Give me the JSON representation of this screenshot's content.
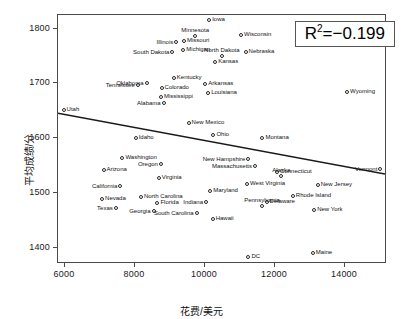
{
  "chart_data": {
    "type": "scatter",
    "title": "",
    "xlabel": "花费/美元",
    "ylabel": "平均成绩/分",
    "xlim": [
      5800,
      15200
    ],
    "ylim": [
      1370,
      1825
    ],
    "xticks": [
      "6000",
      "8000",
      "10000",
      "12000",
      "14000"
    ],
    "xtick_values": [
      6000,
      8000,
      10000,
      12000,
      14000
    ],
    "yticks": [
      "1400",
      "1500",
      "1600",
      "1700",
      "1800"
    ],
    "ytick_values": [
      1400,
      1500,
      1600,
      1700,
      1800
    ],
    "grid": false,
    "legend": null,
    "annotation": {
      "text": "R2=-0.199",
      "display": "R",
      "sup": "2",
      "rest": "=−0.199",
      "position": "top-right"
    },
    "trendline": {
      "type": "linear",
      "x_start": 5800,
      "y_start": 1644,
      "x_end": 15200,
      "y_end": 1532,
      "color": "#1a1a1a"
    },
    "point_color": "#2a2a2a",
    "points": [
      {
        "label": "Iowa",
        "x": 10120,
        "y": 1815,
        "lpos": "r"
      },
      {
        "label": "Wisconsin",
        "x": 11030,
        "y": 1788,
        "lpos": "r"
      },
      {
        "label": "Minnesota",
        "x": 9720,
        "y": 1786,
        "lpos": "t"
      },
      {
        "label": "Missouri",
        "x": 9400,
        "y": 1778,
        "lpos": "r"
      },
      {
        "label": "Illinois",
        "x": 9180,
        "y": 1776,
        "lpos": "l"
      },
      {
        "label": "Michigan",
        "x": 9380,
        "y": 1761,
        "lpos": "r"
      },
      {
        "label": "South Dakota",
        "x": 9070,
        "y": 1758,
        "lpos": "l"
      },
      {
        "label": "Nebraska",
        "x": 11160,
        "y": 1757,
        "lpos": "r"
      },
      {
        "label": "North Dakota",
        "x": 10480,
        "y": 1750,
        "lpos": "t"
      },
      {
        "label": "Kansas",
        "x": 10290,
        "y": 1739,
        "lpos": "r"
      },
      {
        "label": "Kentucky",
        "x": 9110,
        "y": 1709,
        "lpos": "r"
      },
      {
        "label": "Oklahoma",
        "x": 8330,
        "y": 1701,
        "lpos": "l"
      },
      {
        "label": "Tennessee",
        "x": 8080,
        "y": 1698,
        "lpos": "l"
      },
      {
        "label": "Arkansas",
        "x": 10010,
        "y": 1699,
        "lpos": "r"
      },
      {
        "label": "Colorado",
        "x": 8760,
        "y": 1691,
        "lpos": "r"
      },
      {
        "label": "Louisiana",
        "x": 10090,
        "y": 1683,
        "lpos": "r"
      },
      {
        "label": "Wyoming",
        "x": 14060,
        "y": 1684,
        "lpos": "r"
      },
      {
        "label": "Mississippi",
        "x": 8740,
        "y": 1676,
        "lpos": "r"
      },
      {
        "label": "Alabama",
        "x": 8820,
        "y": 1665,
        "lpos": "l"
      },
      {
        "label": "Utah",
        "x": 5960,
        "y": 1651,
        "lpos": "r"
      },
      {
        "label": "New Mexico",
        "x": 9530,
        "y": 1628,
        "lpos": "r"
      },
      {
        "label": "Ohio",
        "x": 10240,
        "y": 1605,
        "lpos": "r"
      },
      {
        "label": "Montana",
        "x": 11640,
        "y": 1601,
        "lpos": "r"
      },
      {
        "label": "Idaho",
        "x": 8020,
        "y": 1600,
        "lpos": "r"
      },
      {
        "label": "Washington",
        "x": 7640,
        "y": 1564,
        "lpos": "r"
      },
      {
        "label": "New Hampshire",
        "x": 11240,
        "y": 1561,
        "lpos": "l"
      },
      {
        "label": "Oregon",
        "x": 8740,
        "y": 1552,
        "lpos": "l"
      },
      {
        "label": "Massachusetts",
        "x": 11430,
        "y": 1549,
        "lpos": "l"
      },
      {
        "label": "Vermont",
        "x": 15010,
        "y": 1544,
        "lpos": "l"
      },
      {
        "label": "Arizona",
        "x": 7100,
        "y": 1542,
        "lpos": "r"
      },
      {
        "label": "Connecticut",
        "x": 12060,
        "y": 1538,
        "lpos": "r"
      },
      {
        "label": "Alaska",
        "x": 12180,
        "y": 1531,
        "lpos": "t"
      },
      {
        "label": "Virginia",
        "x": 8680,
        "y": 1527,
        "lpos": "r"
      },
      {
        "label": "California",
        "x": 7580,
        "y": 1512,
        "lpos": "l"
      },
      {
        "label": "West Virginia",
        "x": 11200,
        "y": 1516,
        "lpos": "r"
      },
      {
        "label": "New Jersey",
        "x": 13220,
        "y": 1514,
        "lpos": "r"
      },
      {
        "label": "Maryland",
        "x": 10150,
        "y": 1503,
        "lpos": "r"
      },
      {
        "label": "Rhode Island",
        "x": 12510,
        "y": 1494,
        "lpos": "r"
      },
      {
        "label": "North Carolina",
        "x": 8170,
        "y": 1492,
        "lpos": "r"
      },
      {
        "label": "Nevada",
        "x": 7060,
        "y": 1488,
        "lpos": "r"
      },
      {
        "label": "Indiana",
        "x": 10030,
        "y": 1483,
        "lpos": "l"
      },
      {
        "label": "Florida",
        "x": 8640,
        "y": 1482,
        "lpos": "r"
      },
      {
        "label": "Delaware",
        "x": 11760,
        "y": 1483,
        "lpos": "r"
      },
      {
        "label": "Pennsylvania",
        "x": 11630,
        "y": 1476,
        "lpos": "t"
      },
      {
        "label": "Texas",
        "x": 7450,
        "y": 1473,
        "lpos": "l"
      },
      {
        "label": "New York",
        "x": 13120,
        "y": 1468,
        "lpos": "r"
      },
      {
        "label": "Georgia",
        "x": 8530,
        "y": 1466,
        "lpos": "l"
      },
      {
        "label": "South Carolina",
        "x": 9760,
        "y": 1463,
        "lpos": "l"
      },
      {
        "label": "Hawaii",
        "x": 10220,
        "y": 1453,
        "lpos": "r"
      },
      {
        "label": "Maine",
        "x": 13080,
        "y": 1391,
        "lpos": "r"
      },
      {
        "label": "DC",
        "x": 11240,
        "y": 1383,
        "lpos": "r"
      }
    ]
  }
}
